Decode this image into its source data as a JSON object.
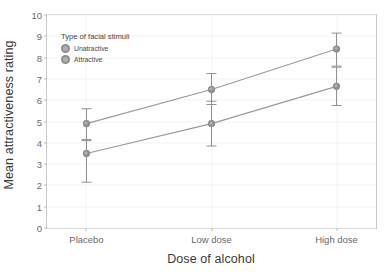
{
  "chart_data": {
    "type": "line",
    "title": "",
    "xlabel": "Dose of alcohol",
    "ylabel": "Mean attractiveness rating",
    "categories": [
      "Placebo",
      "Low dose",
      "High dose"
    ],
    "ylim": [
      0,
      10
    ],
    "yticks": [
      0,
      1,
      2,
      3,
      4,
      5,
      6,
      7,
      8,
      9,
      10
    ],
    "ytick_labels": [
      "0",
      "1",
      "2",
      "3",
      "4",
      "5",
      "6",
      "7",
      "8",
      "9",
      "10"
    ],
    "grid": true,
    "legend_position": "top-left-inside",
    "legend_title": "Type of facial stimuli",
    "series": [
      {
        "name": "Unatractive",
        "color": "#8f8f8f",
        "values": [
          4.9,
          6.5,
          8.4
        ],
        "error_low": [
          4.1,
          5.8,
          7.6
        ],
        "error_high": [
          5.6,
          7.25,
          9.15
        ]
      },
      {
        "name": "Attractive",
        "color": "#8f8f8f",
        "values": [
          3.5,
          4.9,
          6.65
        ],
        "error_low": [
          2.15,
          3.85,
          5.75
        ],
        "error_high": [
          4.15,
          5.95,
          7.55
        ]
      }
    ]
  },
  "axis": {
    "x_title": "Dose of alcohol",
    "y_title": "Mean attractiveness rating"
  },
  "legend": {
    "title": "Type of facial stimuli",
    "items": [
      {
        "label": "Unatractive",
        "color": "#8f8f8f"
      },
      {
        "label": "Attractive",
        "color": "#8f8f8f"
      }
    ]
  },
  "colors": {
    "panel_border": "#c9c9c9",
    "gridline": "#f4f4f4",
    "marker": "#8f8f8f",
    "line": "#9a9a9a",
    "tick_text": "#6b6b6b",
    "title_text": "#3a3a3a"
  }
}
